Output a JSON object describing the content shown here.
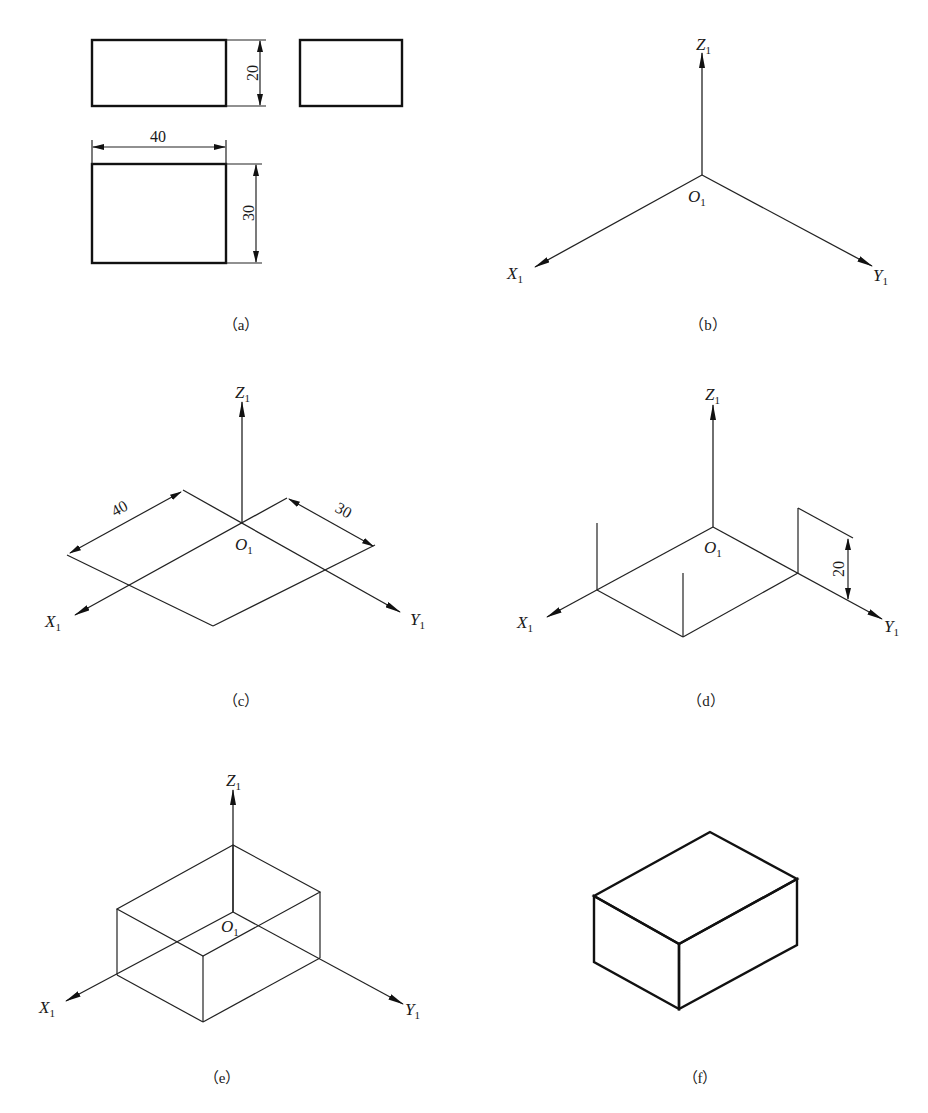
{
  "figure": {
    "panels": [
      {
        "id": "a",
        "caption": "（a）",
        "description": "Three-view orthographic drawing of a rectangular block",
        "dimensions": {
          "height": "20",
          "length": "40",
          "width": "30"
        }
      },
      {
        "id": "b",
        "caption": "（b）",
        "description": "Isometric axes",
        "labels": {
          "x": "X",
          "y": "Y",
          "z": "Z",
          "o": "O",
          "sub": "1"
        }
      },
      {
        "id": "c",
        "caption": "（c）",
        "description": "Measure length and width along isometric axes",
        "dimensions": {
          "length": "40",
          "width": "30"
        },
        "labels": {
          "x": "X",
          "y": "Y",
          "z": "Z",
          "o": "O",
          "sub": "1"
        }
      },
      {
        "id": "d",
        "caption": "（d）",
        "description": "Raise vertical edges to height",
        "dimensions": {
          "height": "20"
        },
        "labels": {
          "x": "X",
          "y": "Y",
          "z": "Z",
          "o": "O",
          "sub": "1"
        }
      },
      {
        "id": "e",
        "caption": "（e）",
        "description": "Connect top edges to form box",
        "labels": {
          "x": "X",
          "y": "Y",
          "z": "Z",
          "o": "O",
          "sub": "1"
        }
      },
      {
        "id": "f",
        "caption": "（f）",
        "description": "Finished isometric drawing of the block"
      }
    ]
  }
}
